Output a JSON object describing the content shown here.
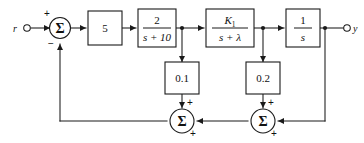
{
  "diagram": {
    "type": "control-block-diagram",
    "background_color": "#ffffff",
    "line_color": "#1a1a1a",
    "input": {
      "label": "r",
      "terminal": "open-circle"
    },
    "output": {
      "label": "y",
      "terminal": "open-circle"
    },
    "summers": [
      {
        "id": "summer-input",
        "symbol": "Σ",
        "signs": {
          "from_input": "+",
          "from_feedback": "−"
        }
      },
      {
        "id": "summer-inner",
        "symbol": "Σ",
        "signs": {
          "from_gain": "+",
          "from_right": "+"
        }
      },
      {
        "id": "summer-outer",
        "symbol": "Σ",
        "signs": {
          "from_gain": "+",
          "from_output": "+"
        }
      }
    ],
    "forward_blocks": [
      {
        "id": "gain-5",
        "kind": "gain",
        "label": "5"
      },
      {
        "id": "tf-2-over-s-plus-10",
        "kind": "transfer-function",
        "numerator": "2",
        "denominator": "s + 10"
      },
      {
        "id": "tf-k1-over-s-plus-lambda",
        "kind": "transfer-function",
        "numerator_base": "K",
        "numerator_sub": "1",
        "denominator_prefix": "s + ",
        "denominator_symbol": "λ"
      },
      {
        "id": "integrator",
        "kind": "transfer-function",
        "numerator": "1",
        "denominator": "s"
      }
    ],
    "feedback_blocks": [
      {
        "id": "gain-0p1",
        "kind": "gain",
        "label": "0.1"
      },
      {
        "id": "gain-0p2",
        "kind": "gain",
        "label": "0.2"
      }
    ],
    "signs": {
      "plus": "+",
      "minus": "−"
    }
  }
}
